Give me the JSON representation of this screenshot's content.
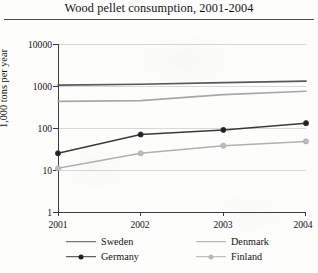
{
  "chart_data": {
    "type": "line",
    "title": "Wood pellet consumption, 2001-2004",
    "xlabel": "",
    "ylabel": "1,000 tons per year",
    "x": [
      "2001",
      "2002",
      "2003",
      "2004"
    ],
    "categories": [
      "2001",
      "2002",
      "2003",
      "2004"
    ],
    "yscale": "log",
    "ylim": [
      1,
      10000
    ],
    "yticks": [
      "1",
      "10",
      "100",
      "1000",
      "10000"
    ],
    "grid": "horizontal",
    "legend_position": "bottom",
    "series": [
      {
        "name": "Sweden",
        "values": [
          1050,
          1100,
          1200,
          1300
        ],
        "color": "#58585a",
        "marker": "none"
      },
      {
        "name": "Denmark",
        "values": [
          430,
          450,
          620,
          750
        ],
        "color": "#a8a8aa",
        "marker": "none"
      },
      {
        "name": "Germany",
        "values": [
          25,
          70,
          90,
          130
        ],
        "color": "#3a3a3c",
        "marker": "circle"
      },
      {
        "name": "Finland",
        "values": [
          11,
          25,
          38,
          48
        ],
        "color": "#b0b0b2",
        "marker": "circle"
      }
    ]
  },
  "legend": {
    "items": [
      {
        "label": "Sweden"
      },
      {
        "label": "Denmark"
      },
      {
        "label": "Germany"
      },
      {
        "label": "Finland"
      }
    ]
  }
}
